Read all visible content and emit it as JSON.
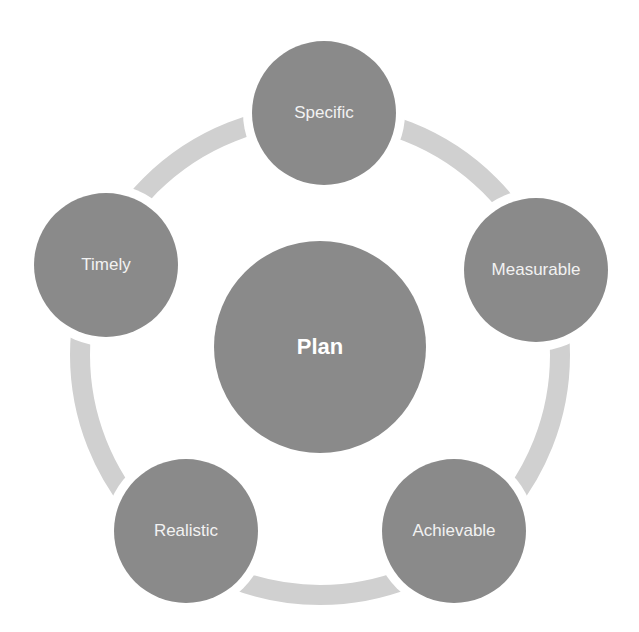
{
  "diagram": {
    "type": "cycle",
    "center": {
      "label": "Plan",
      "cx": 320,
      "cy": 347,
      "r": 106
    },
    "ring": {
      "cx": 320,
      "cy": 355,
      "r": 240,
      "stroke_width": 20
    },
    "nodes": [
      {
        "label": "Specific",
        "cx": 324,
        "cy": 113,
        "r": 72
      },
      {
        "label": "Measurable",
        "cx": 536,
        "cy": 270,
        "r": 72
      },
      {
        "label": "Achievable",
        "cx": 454,
        "cy": 531,
        "r": 72
      },
      {
        "label": "Realistic",
        "cx": 186,
        "cy": 531,
        "r": 72
      },
      {
        "label": "Timely",
        "cx": 106,
        "cy": 265,
        "r": 72
      }
    ],
    "colors": {
      "node_fill": "#8a8a8a",
      "ring_fill": "#d0d0d0",
      "label_text": "#f2f2f2",
      "background": "#ffffff"
    }
  }
}
